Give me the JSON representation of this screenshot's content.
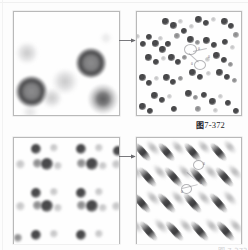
{
  "figure": {
    "caption_cn": "图",
    "caption_num": "7-372",
    "caption_full": "图 7-372",
    "bottom_caption_clip": "图 7-373"
  },
  "panels": [
    {
      "id": "panel-tl",
      "name": "top-left-low-magnification",
      "description": "Low magnification diffraction pattern with large diffuse spots",
      "position": "top-left"
    },
    {
      "id": "panel-tr",
      "name": "top-right-high-magnification",
      "description": "High magnification diffraction pattern with rows of small spots along diagonal rows",
      "position": "top-right"
    },
    {
      "id": "panel-bl",
      "name": "bottom-left-low-magnification",
      "description": "Low magnification ordered lattice of dark spots with faint satellites",
      "position": "bottom-left"
    },
    {
      "id": "panel-br",
      "name": "bottom-right-high-magnification",
      "description": "High magnification pattern of elongated diagonal streaks",
      "position": "bottom-right"
    }
  ],
  "arrows": [
    {
      "name": "arrow-top",
      "direction": "right",
      "from": "panel-tl",
      "to": "panel-tr"
    },
    {
      "name": "arrow-bottom",
      "direction": "right",
      "from": "panel-bl",
      "to": "panel-br"
    }
  ],
  "annotations": {
    "top_right": [
      {
        "label": "0",
        "x": 61,
        "y": 37
      },
      {
        "label": "0",
        "x": 70,
        "y": 44
      },
      {
        "label": "0",
        "x": 55,
        "y": 50
      }
    ],
    "bottom_right": [
      {
        "label": "0",
        "x": 66,
        "y": 26
      },
      {
        "label": "0",
        "x": 62,
        "y": 44
      },
      {
        "label": "0",
        "x": 45,
        "y": 52
      }
    ]
  },
  "colors": {
    "spot_dark": "#3a3a3c",
    "spot_mid": "#6e6e70",
    "spot_pale": "#b0b0b2",
    "panel_border": "#b9b9b9",
    "page_background": "#fdfdfd",
    "caption_text": "#23232a",
    "arrow": "#6a6a6e"
  }
}
